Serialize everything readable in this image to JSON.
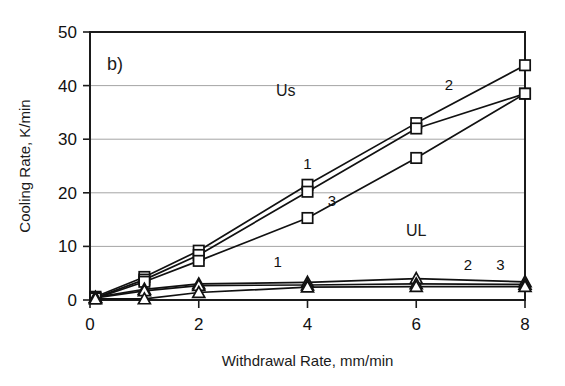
{
  "chart_data": {
    "type": "line",
    "title": "",
    "panel_label": "b)",
    "xlabel": "Withdrawal Rate, mm/min",
    "ylabel": "Cooling Rate, K/min",
    "xlim": [
      0,
      8
    ],
    "ylim": [
      0,
      50
    ],
    "xticks": [
      0,
      2,
      4,
      6,
      8
    ],
    "yticks": [
      0,
      10,
      20,
      30,
      40,
      50
    ],
    "xtick_labels": [
      "0",
      "2",
      "4",
      "6",
      "8"
    ],
    "ytick_labels": [
      "0",
      "10",
      "20",
      "30",
      "40",
      "50"
    ],
    "grid": "horizontal",
    "legend_position": "inline-annotations",
    "group_labels": [
      {
        "text": "Us",
        "x": 3.6,
        "y": 38.0
      },
      {
        "text": "UL",
        "x": 6.0,
        "y": 12.0
      }
    ],
    "series": [
      {
        "name": "Us 1",
        "group": "Us",
        "label": "1",
        "marker": "square",
        "label_x": 4.0,
        "label_y": 24.4,
        "x": [
          0.1,
          1.0,
          2.0,
          4.0,
          6.0,
          8.0
        ],
        "y": [
          0.6,
          4.3,
          9.2,
          21.5,
          33.0,
          43.8
        ]
      },
      {
        "name": "Us 2",
        "group": "Us",
        "label": "2",
        "marker": "square",
        "label_x": 6.6,
        "label_y": 39.2,
        "x": [
          0.1,
          1.0,
          2.0,
          4.0,
          6.0,
          8.0
        ],
        "y": [
          0.4,
          3.8,
          8.4,
          20.2,
          32.0,
          38.5
        ]
      },
      {
        "name": "Us 3",
        "group": "Us",
        "label": "3",
        "marker": "square",
        "label_x": 4.45,
        "label_y": 17.6,
        "x": [
          0.1,
          1.0,
          2.0,
          4.0,
          6.0,
          8.0
        ],
        "y": [
          0.3,
          3.4,
          7.3,
          15.3,
          26.5,
          38.5
        ]
      },
      {
        "name": "UL 1",
        "group": "UL",
        "label": "1",
        "marker": "triangle",
        "label_x": 3.45,
        "label_y": 6.2,
        "x": [
          0.1,
          1.0,
          2.0,
          4.0,
          6.0,
          8.0
        ],
        "y": [
          0.5,
          2.0,
          3.0,
          3.3,
          4.0,
          3.4
        ]
      },
      {
        "name": "UL 2",
        "group": "UL",
        "label": "2",
        "marker": "triangle",
        "label_x": 6.95,
        "label_y": 5.6,
        "x": [
          0.1,
          1.0,
          2.0,
          4.0,
          6.0,
          8.0
        ],
        "y": [
          0.4,
          1.7,
          2.7,
          2.8,
          3.0,
          2.9
        ]
      },
      {
        "name": "UL 3",
        "group": "UL",
        "label": "3",
        "marker": "triangle",
        "label_x": 7.55,
        "label_y": 5.6,
        "x": [
          0.1,
          1.0,
          2.0,
          4.0,
          6.0,
          8.0
        ],
        "y": [
          0.2,
          0.2,
          1.4,
          2.4,
          2.5,
          2.5
        ]
      }
    ]
  }
}
